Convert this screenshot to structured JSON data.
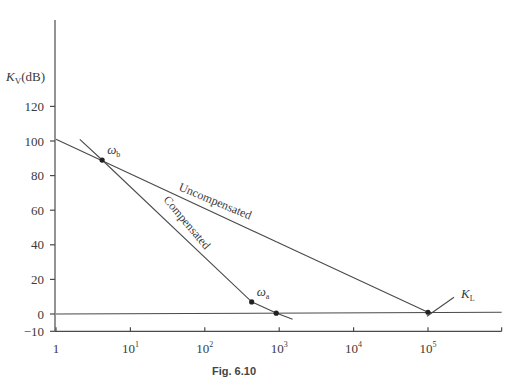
{
  "chart_data": {
    "type": "line",
    "title": "",
    "caption": "Fig. 6.10",
    "xlabel": "",
    "ylabel": "K_V(dB)",
    "ylabel_main": "K",
    "ylabel_sub": "V",
    "ylabel_unit": "(dB)",
    "x_scale": "log",
    "xlim_log10": [
      0,
      5.99
    ],
    "ylim": [
      -10,
      150
    ],
    "grid": false,
    "x_ticks": [
      {
        "log10": 0,
        "label": "1",
        "base": "1",
        "exp": ""
      },
      {
        "log10": 1,
        "label": "10^1",
        "base": "10",
        "exp": "1"
      },
      {
        "log10": 2,
        "label": "10^2",
        "base": "10",
        "exp": "2"
      },
      {
        "log10": 3,
        "label": "10^3",
        "base": "10",
        "exp": "3"
      },
      {
        "log10": 4,
        "label": "10^4",
        "base": "10",
        "exp": "4"
      },
      {
        "log10": 5,
        "label": "10^5",
        "base": "10",
        "exp": "5"
      }
    ],
    "y_ticks": [
      120,
      100,
      80,
      60,
      40,
      20,
      0,
      -10
    ],
    "series": [
      {
        "name": "Uncompensated",
        "points_log10_x": [
          [
            0,
            101
          ],
          [
            5,
            1
          ]
        ]
      },
      {
        "name": "Compensated",
        "points_log10_x": [
          [
            0.32,
            101
          ],
          [
            0.62,
            89
          ],
          [
            2.63,
            7
          ],
          [
            2.96,
            0.5
          ],
          [
            3.18,
            -3
          ]
        ]
      },
      {
        "name": "0 dB line",
        "points_log10_x": [
          [
            0,
            0
          ],
          [
            5.99,
            1
          ]
        ]
      }
    ],
    "markers": [
      {
        "name": "omega_b",
        "label_main": "ω",
        "label_sub": "b",
        "log10_x": 0.62,
        "y": 89
      },
      {
        "name": "omega_a",
        "label_main": "ω",
        "label_sub": "a",
        "log10_x": 2.63,
        "y": 7
      },
      {
        "name": "unity",
        "label_main": "",
        "label_sub": "",
        "log10_x": 2.96,
        "y": 0.5
      },
      {
        "name": "K_L",
        "label_main": "K",
        "label_sub": "L",
        "log10_x": 5.0,
        "y": 1
      }
    ],
    "annotations": [
      {
        "text": "Uncompensated",
        "on_series": "Uncompensated"
      },
      {
        "text": "Compensated",
        "on_series": "Compensated"
      }
    ]
  }
}
